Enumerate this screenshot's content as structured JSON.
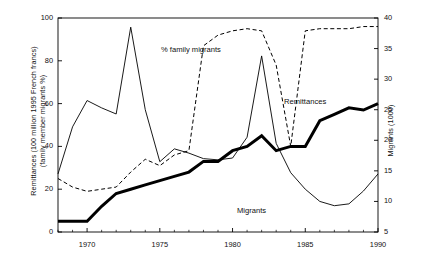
{
  "chart_data": {
    "type": "line",
    "title": "",
    "xlabel": "",
    "ylabel": "Remittances (100 million 1995 French francs) (family member migrants %)",
    "y2label": "Migrants (1000)",
    "xlim": [
      1968,
      1990
    ],
    "ylim": [
      0,
      100
    ],
    "y2lim": [
      5,
      40
    ],
    "grid": false,
    "legend_position": "inline-annotations",
    "xticks": [
      1970,
      1975,
      1980,
      1985,
      1990
    ],
    "xtick_labels": [
      "1970",
      "1975",
      "1980",
      "1985",
      "1990"
    ],
    "yticks": [
      0,
      20,
      40,
      60,
      80,
      100
    ],
    "ytick_labels": [
      "0",
      "20",
      "40",
      "60",
      "80",
      "100"
    ],
    "y2ticks": [
      5,
      10,
      15,
      20,
      25,
      30,
      35,
      40
    ],
    "y2tick_labels": [
      "5",
      "10",
      "15",
      "20",
      "25",
      "30",
      "35",
      "40"
    ],
    "x": [
      1968,
      1969,
      1970,
      1971,
      1972,
      1973,
      1974,
      1975,
      1976,
      1977,
      1978,
      1979,
      1980,
      1981,
      1982,
      1983,
      1984,
      1985,
      1986,
      1987,
      1988,
      1989,
      1990
    ],
    "series": [
      {
        "name": "Remittances",
        "axis": "left",
        "style": "thick-solid",
        "color": "#000000",
        "values": [
          5,
          5,
          5,
          12,
          18,
          20,
          22,
          24,
          26,
          28,
          33,
          33,
          38,
          40,
          45,
          38,
          40,
          40,
          52,
          55,
          58,
          57,
          60
        ]
      },
      {
        "name": "% family migrants",
        "axis": "left",
        "style": "dashed",
        "color": "#000000",
        "values": [
          25,
          21,
          19,
          20,
          21,
          28,
          34,
          31,
          36,
          38,
          87,
          92,
          94,
          95,
          94,
          78,
          40,
          94,
          95,
          95,
          95,
          96,
          96
        ]
      },
      {
        "name": "Migrants",
        "axis": "right",
        "style": "thin-solid",
        "color": "#000000",
        "values": [
          14.5,
          22.2,
          26.5,
          25.3,
          24.3,
          38.5,
          25.0,
          16.5,
          18.6,
          17.9,
          17.0,
          16.8,
          17.1,
          20.5,
          33.8,
          19.5,
          14.7,
          12.0,
          10.0,
          9.3,
          9.6,
          11.7,
          14.5
        ]
      }
    ],
    "annotations": [
      {
        "text": "% family migrants",
        "x_px": 161,
        "y_px": 45
      },
      {
        "text": "Remittances",
        "x_px": 284,
        "y_px": 97
      },
      {
        "text": "Migrants",
        "x_px": 237,
        "y_px": 206
      }
    ]
  },
  "axes": {
    "left_title_line1": "Remittances (100 million 1995 French francs)",
    "left_title_line2": "(family member migrants %)",
    "right_title": "Migrants (1000)"
  }
}
